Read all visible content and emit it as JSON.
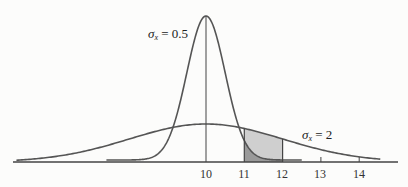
{
  "chart_data": {
    "type": "line",
    "title": "",
    "xlabel": "",
    "ylabel": "",
    "xlim": [
      5.0,
      15.0
    ],
    "x_ticks": [
      10,
      11,
      12,
      13,
      14
    ],
    "x_tick_labels": [
      "10",
      "11",
      "12",
      "13",
      "14"
    ],
    "grid": false,
    "legend": "none",
    "series": [
      {
        "name": "sigma_x = 0.5",
        "distribution": "normal",
        "mean": 10,
        "sd": 0.5,
        "x_range": [
          7.5,
          12.5
        ],
        "peak_relative_height": 1.0
      },
      {
        "name": "sigma_x = 2",
        "distribution": "normal",
        "mean": 10,
        "sd": 2,
        "x_range": [
          5.0,
          14.5
        ],
        "peak_relative_height": 0.25
      }
    ],
    "shaded_regions": [
      {
        "series": "sigma_x = 2",
        "x_from": 11,
        "x_to": 12,
        "fill": "light gray"
      },
      {
        "series": "sigma_x = 0.5",
        "x_from": 11,
        "x_to": 12,
        "fill": "dark gray"
      }
    ],
    "vertical_lines": [
      10,
      11,
      12
    ],
    "annotations": [
      {
        "text": "σx = 0.5",
        "near": "narrow curve peak, left"
      },
      {
        "text": "σx = 2",
        "near": "wide curve right tail"
      }
    ]
  },
  "labels": {
    "narrow": {
      "sym": "σ",
      "sub": "x",
      "rest": " = 0.5"
    },
    "wide": {
      "sym": "σ",
      "sub": "x",
      "rest": " = 2"
    },
    "ticks": [
      "10",
      "11",
      "12",
      "13",
      "14"
    ]
  },
  "colors": {
    "curve": "#555555",
    "axis": "#444444",
    "shade_light": "#cfcfcf",
    "shade_dark": "#9a9a9a",
    "background": "#fcfcfb"
  }
}
